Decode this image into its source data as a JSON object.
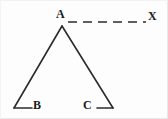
{
  "figure": {
    "background_color": "#fdfdfd",
    "stroke_color": "#2b2b2b",
    "border_color": "#e8e8e8",
    "width": 168,
    "height": 119,
    "labels": {
      "apex": "A",
      "left_base": "B",
      "right_base": "C",
      "ray_end": "X"
    },
    "points": {
      "A": {
        "x": 62,
        "y": 26
      },
      "B": {
        "x": 14,
        "y": 108
      },
      "C": {
        "x": 113,
        "y": 108
      },
      "X": {
        "x": 146,
        "y": 22
      }
    },
    "segments": [
      {
        "name": "side-AB",
        "from": "A",
        "to": "B",
        "style": "solid"
      },
      {
        "name": "side-AC",
        "from": "A",
        "to": "C",
        "style": "solid"
      },
      {
        "name": "tick-B",
        "x1": 14,
        "y1": 108,
        "x2": 32,
        "y2": 108,
        "style": "solid"
      },
      {
        "name": "tick-C",
        "x1": 113,
        "y1": 108,
        "x2": 97,
        "y2": 108,
        "style": "solid"
      },
      {
        "name": "ray-AX",
        "x1": 68,
        "y1": 22,
        "x2": 146,
        "y2": 22,
        "style": "dashed"
      }
    ],
    "dash_pattern": "9 6",
    "stroke_width": 1.6
  }
}
